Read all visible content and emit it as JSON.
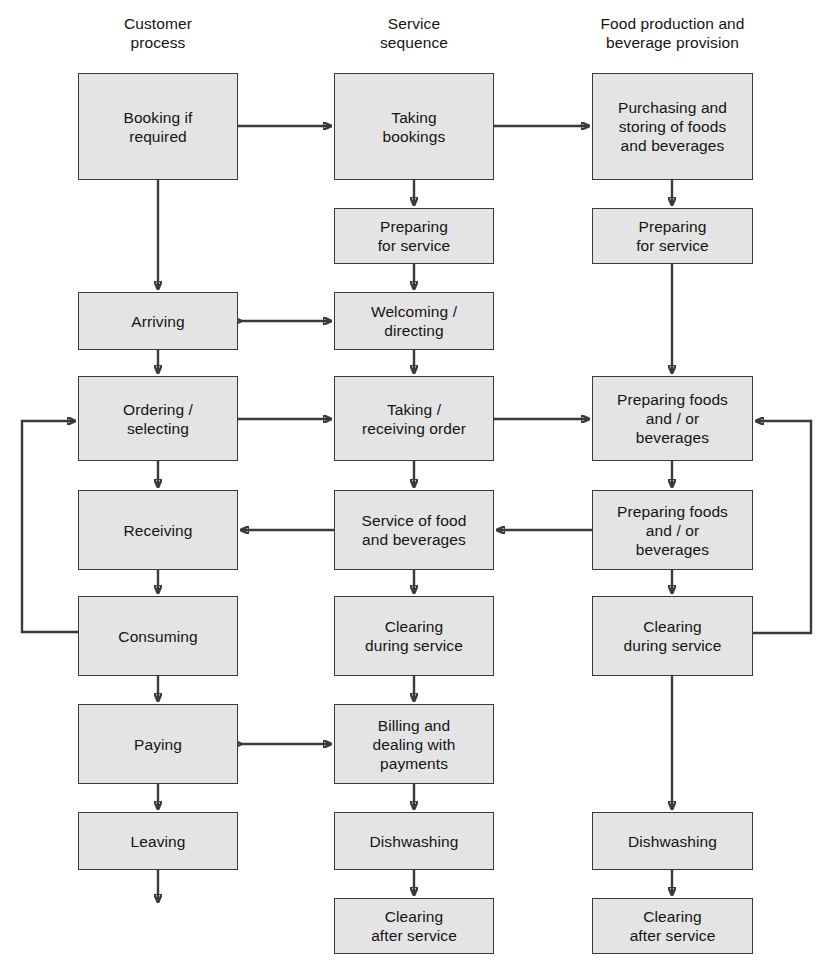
{
  "diagram": {
    "box_fill": "#e4e4e4",
    "line_color": "#3a3a3a",
    "background": "#ffffff",
    "columns": [
      {
        "id": "customer",
        "header": "Customer\nprocess"
      },
      {
        "id": "service",
        "header": "Service\nsequence"
      },
      {
        "id": "production",
        "header": "Food production and\nbeverage provision"
      }
    ],
    "nodes": [
      {
        "id": "booking-if-required",
        "column": "customer",
        "label": "Booking if\nrequired",
        "x": 78,
        "y": 73,
        "w": 160,
        "h": 107
      },
      {
        "id": "arriving",
        "column": "customer",
        "label": "Arriving",
        "x": 78,
        "y": 292,
        "w": 160,
        "h": 58
      },
      {
        "id": "ordering-selecting",
        "column": "customer",
        "label": "Ordering  /\nselecting",
        "x": 78,
        "y": 376,
        "w": 160,
        "h": 85
      },
      {
        "id": "receiving",
        "column": "customer",
        "label": "Receiving",
        "x": 78,
        "y": 490,
        "w": 160,
        "h": 80
      },
      {
        "id": "consuming",
        "column": "customer",
        "label": "Consuming",
        "x": 78,
        "y": 596,
        "w": 160,
        "h": 80
      },
      {
        "id": "paying",
        "column": "customer",
        "label": "Paying",
        "x": 78,
        "y": 704,
        "w": 160,
        "h": 80
      },
      {
        "id": "leaving",
        "column": "customer",
        "label": "Leaving",
        "x": 78,
        "y": 812,
        "w": 160,
        "h": 58
      },
      {
        "id": "taking-bookings",
        "column": "service",
        "label": "Taking\nbookings",
        "x": 334,
        "y": 73,
        "w": 160,
        "h": 107
      },
      {
        "id": "preparing-for-service-s",
        "column": "service",
        "label": "Preparing\nfor service",
        "x": 334,
        "y": 208,
        "w": 160,
        "h": 56
      },
      {
        "id": "welcoming-directing",
        "column": "service",
        "label": "Welcoming /\ndirecting",
        "x": 334,
        "y": 292,
        "w": 160,
        "h": 58
      },
      {
        "id": "taking-receiving-order",
        "column": "service",
        "label": "Taking /\nreceiving order",
        "x": 334,
        "y": 376,
        "w": 160,
        "h": 85
      },
      {
        "id": "service-of-food",
        "column": "service",
        "label": "Service of food\nand beverages",
        "x": 334,
        "y": 490,
        "w": 160,
        "h": 80
      },
      {
        "id": "clearing-during-service-s",
        "column": "service",
        "label": "Clearing\nduring service",
        "x": 334,
        "y": 596,
        "w": 160,
        "h": 80
      },
      {
        "id": "billing-and-payments",
        "column": "service",
        "label": "Billing and\ndealing with\npayments",
        "x": 334,
        "y": 704,
        "w": 160,
        "h": 80
      },
      {
        "id": "dishwashing-s",
        "column": "service",
        "label": "Dishwashing",
        "x": 334,
        "y": 812,
        "w": 160,
        "h": 58
      },
      {
        "id": "clearing-after-service-s",
        "column": "service",
        "label": "Clearing\nafter service",
        "x": 334,
        "y": 898,
        "w": 160,
        "h": 56
      },
      {
        "id": "purchasing-storing",
        "column": "production",
        "label": "Purchasing and\nstoring of foods\nand beverages",
        "x": 592,
        "y": 73,
        "w": 161,
        "h": 107
      },
      {
        "id": "preparing-for-service-p",
        "column": "production",
        "label": "Preparing\nfor service",
        "x": 592,
        "y": 208,
        "w": 161,
        "h": 56
      },
      {
        "id": "preparing-foods-1",
        "column": "production",
        "label": "Preparing foods\nand / or\nbeverages",
        "x": 592,
        "y": 376,
        "w": 161,
        "h": 85
      },
      {
        "id": "preparing-foods-2",
        "column": "production",
        "label": "Preparing foods\nand / or\nbeverages",
        "x": 592,
        "y": 490,
        "w": 161,
        "h": 80
      },
      {
        "id": "clearing-during-service-p",
        "column": "production",
        "label": "Clearing\nduring service",
        "x": 592,
        "y": 596,
        "w": 161,
        "h": 80
      },
      {
        "id": "dishwashing-p",
        "column": "production",
        "label": "Dishwashing",
        "x": 592,
        "y": 812,
        "w": 161,
        "h": 58
      },
      {
        "id": "clearing-after-service-p",
        "column": "production",
        "label": "Clearing\nafter service",
        "x": 592,
        "y": 898,
        "w": 161,
        "h": 56
      }
    ],
    "edges": [
      {
        "id": "booking-to-taking-bookings",
        "from": "booking-if-required",
        "to": "taking-bookings",
        "kind": "horizontal-arrow"
      },
      {
        "id": "taking-bookings-to-purchasing",
        "from": "taking-bookings",
        "to": "purchasing-storing",
        "kind": "horizontal-arrow"
      },
      {
        "id": "booking-to-arriving",
        "from": "booking-if-required",
        "to": "arriving",
        "kind": "vertical-arrow"
      },
      {
        "id": "taking-bookings-to-preparing-s",
        "from": "taking-bookings",
        "to": "preparing-for-service-s",
        "kind": "vertical-arrow"
      },
      {
        "id": "purchasing-to-preparing-p",
        "from": "purchasing-storing",
        "to": "preparing-for-service-p",
        "kind": "vertical-arrow"
      },
      {
        "id": "preparing-s-to-welcoming",
        "from": "preparing-for-service-s",
        "to": "welcoming-directing",
        "kind": "vertical-arrow"
      },
      {
        "id": "arriving-welcoming-bidirectional",
        "from": "arriving",
        "to": "welcoming-directing",
        "kind": "double-arrow"
      },
      {
        "id": "arriving-to-ordering",
        "from": "arriving",
        "to": "ordering-selecting",
        "kind": "vertical-arrow"
      },
      {
        "id": "welcoming-to-taking-order",
        "from": "welcoming-directing",
        "to": "taking-receiving-order",
        "kind": "vertical-arrow"
      },
      {
        "id": "ordering-to-taking-order",
        "from": "ordering-selecting",
        "to": "taking-receiving-order",
        "kind": "horizontal-arrow"
      },
      {
        "id": "taking-order-to-preparing-foods-1",
        "from": "taking-receiving-order",
        "to": "preparing-foods-1",
        "kind": "horizontal-arrow"
      },
      {
        "id": "preparing-p-to-preparing-foods-1",
        "from": "preparing-for-service-p",
        "to": "preparing-foods-1",
        "kind": "vertical-arrow"
      },
      {
        "id": "ordering-to-receiving",
        "from": "ordering-selecting",
        "to": "receiving",
        "kind": "vertical-arrow"
      },
      {
        "id": "taking-order-to-service-of-food",
        "from": "taking-receiving-order",
        "to": "service-of-food",
        "kind": "vertical-arrow"
      },
      {
        "id": "preparing-foods-1-to-preparing-foods-2",
        "from": "preparing-foods-1",
        "to": "preparing-foods-2",
        "kind": "vertical-arrow"
      },
      {
        "id": "preparing-foods-2-to-service-of-food",
        "from": "preparing-foods-2",
        "to": "service-of-food",
        "kind": "horizontal-arrow-left"
      },
      {
        "id": "service-of-food-to-receiving",
        "from": "service-of-food",
        "to": "receiving",
        "kind": "horizontal-arrow-left"
      },
      {
        "id": "receiving-to-consuming",
        "from": "receiving",
        "to": "consuming",
        "kind": "vertical-arrow"
      },
      {
        "id": "service-of-food-to-clearing-s",
        "from": "service-of-food",
        "to": "clearing-during-service-s",
        "kind": "vertical-arrow"
      },
      {
        "id": "preparing-foods-2-to-clearing-p",
        "from": "preparing-foods-2",
        "to": "clearing-during-service-p",
        "kind": "vertical-arrow"
      },
      {
        "id": "consuming-back-to-ordering",
        "from": "consuming",
        "to": "ordering-selecting",
        "kind": "feedback-loop-left"
      },
      {
        "id": "clearing-p-back-to-preparing-foods-1",
        "from": "clearing-during-service-p",
        "to": "preparing-foods-1",
        "kind": "feedback-loop-right"
      },
      {
        "id": "consuming-to-paying",
        "from": "consuming",
        "to": "paying",
        "kind": "vertical-arrow"
      },
      {
        "id": "clearing-s-to-billing",
        "from": "clearing-during-service-s",
        "to": "billing-and-payments",
        "kind": "vertical-arrow"
      },
      {
        "id": "clearing-p-to-dishwashing-p",
        "from": "clearing-during-service-p",
        "to": "dishwashing-p",
        "kind": "vertical-arrow"
      },
      {
        "id": "paying-billing-bidirectional",
        "from": "paying",
        "to": "billing-and-payments",
        "kind": "double-arrow"
      },
      {
        "id": "paying-to-leaving",
        "from": "paying",
        "to": "leaving",
        "kind": "vertical-arrow"
      },
      {
        "id": "billing-to-dishwashing-s",
        "from": "billing-and-payments",
        "to": "dishwashing-s",
        "kind": "vertical-arrow"
      },
      {
        "id": "leaving-exit",
        "from": "leaving",
        "to": null,
        "kind": "terminal-arrow"
      },
      {
        "id": "dishwashing-s-to-clearing-after-s",
        "from": "dishwashing-s",
        "to": "clearing-after-service-s",
        "kind": "vertical-arrow"
      },
      {
        "id": "dishwashing-p-to-clearing-after-p",
        "from": "dishwashing-p",
        "to": "clearing-after-service-p",
        "kind": "vertical-arrow"
      }
    ]
  }
}
